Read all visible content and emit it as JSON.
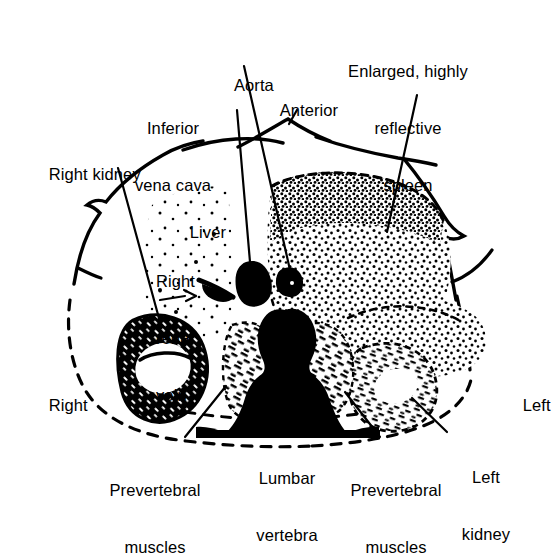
{
  "figure": {
    "type": "anatomical-line-diagram",
    "orientation_labels": {
      "anterior": "Anterior",
      "right": "Right",
      "left": "Left"
    }
  },
  "labels": {
    "aorta": "Aorta",
    "anterior": "Anterior",
    "inferior_vena_cava_line1": "Inferior",
    "inferior_vena_cava_line2": "vena cava",
    "spleen_line1": "Enlarged, highly",
    "spleen_line2": "reflective",
    "spleen_line3": "spleen",
    "right_kidney": "Right kidney",
    "liver": "Liver",
    "right_renal_vein_line1": "Right",
    "right_renal_vein_line2": "renal",
    "right_renal_vein_line3": "vein",
    "right": "Right",
    "left": "Left",
    "prevertebral_muscles_left_line1": "Prevertebral",
    "prevertebral_muscles_left_line2": "muscles",
    "lumbar_vertebra_line1": "Lumbar",
    "lumbar_vertebra_line2": "vertebra",
    "prevertebral_muscles_right_line1": "Prevertebral",
    "prevertebral_muscles_right_line2": "muscles",
    "left_kidney_line1": "Left",
    "left_kidney_line2": "kidney"
  },
  "structures": [
    {
      "name": "aorta",
      "label": "Aorta",
      "rendering": "solid-black-blob"
    },
    {
      "name": "inferior-vena-cava",
      "label": "Inferior vena cava",
      "rendering": "solid-black-blob"
    },
    {
      "name": "lumbar-vertebra",
      "label": "Lumbar vertebra",
      "rendering": "solid-black-silhouette"
    },
    {
      "name": "spleen",
      "label": "Enlarged, highly reflective spleen",
      "rendering": "dense-stipple"
    },
    {
      "name": "liver",
      "label": "Liver",
      "rendering": "sparse-stipple"
    },
    {
      "name": "right-kidney",
      "label": "Right kidney",
      "rendering": "thick-dark-ring"
    },
    {
      "name": "left-kidney",
      "label": "Left kidney",
      "rendering": "stippled-ring"
    },
    {
      "name": "prevertebral-muscles-right",
      "label": "Prevertebral muscles",
      "rendering": "hatched-stipple"
    },
    {
      "name": "prevertebral-muscles-left",
      "label": "Prevertebral muscles",
      "rendering": "hatched-stipple"
    },
    {
      "name": "right-renal-vein",
      "label": "Right renal vein",
      "rendering": "small-dark-streak"
    },
    {
      "name": "body-wall",
      "label": "Body wall outline",
      "rendering": "solid-anterior-dashed-posterior"
    }
  ],
  "colors": {
    "ink": "#000000",
    "background": "#ffffff"
  }
}
